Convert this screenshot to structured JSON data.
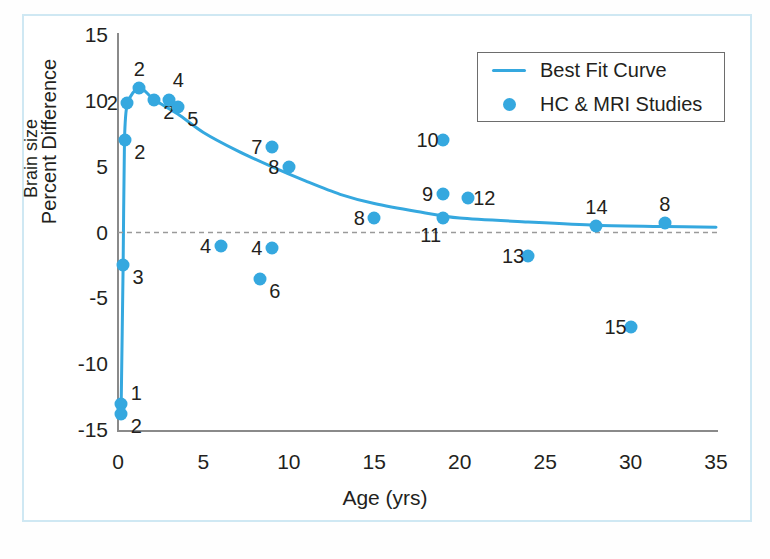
{
  "chart_data": {
    "type": "scatter",
    "title": "",
    "xlabel": "Age (yrs)",
    "ylabel": "Percent Difference",
    "ylabel_2": "Brain size",
    "xlim": [
      0,
      35
    ],
    "ylim": [
      -15,
      15
    ],
    "xticks": [
      "0",
      "5",
      "10",
      "15",
      "20",
      "25",
      "30",
      "35"
    ],
    "yticks": [
      "15",
      "10",
      "5",
      "0",
      "-5",
      "-10",
      "-15"
    ],
    "grid": false,
    "zero_reference_line": 0,
    "legend_position": "top-right",
    "series": [
      {
        "name": "Best Fit Curve",
        "type": "line",
        "color": "#35a8df",
        "points": [
          {
            "x": 0.18,
            "y": -13.6
          },
          {
            "x": 0.3,
            "y": -2.5
          },
          {
            "x": 0.38,
            "y": 7.0
          },
          {
            "x": 0.55,
            "y": 9.8
          },
          {
            "x": 1.25,
            "y": 11.0
          },
          {
            "x": 2.1,
            "y": 10.1
          },
          {
            "x": 3.5,
            "y": 9.0
          },
          {
            "x": 5.0,
            "y": 7.6
          },
          {
            "x": 7.0,
            "y": 6.2
          },
          {
            "x": 9.0,
            "y": 5.0
          },
          {
            "x": 11.0,
            "y": 3.9
          },
          {
            "x": 13.0,
            "y": 2.9
          },
          {
            "x": 15.0,
            "y": 2.2
          },
          {
            "x": 17.5,
            "y": 1.6
          },
          {
            "x": 20.0,
            "y": 1.1
          },
          {
            "x": 24.0,
            "y": 0.8
          },
          {
            "x": 28.0,
            "y": 0.55
          },
          {
            "x": 32.0,
            "y": 0.45
          },
          {
            "x": 35.0,
            "y": 0.4
          }
        ]
      },
      {
        "name": "HC & MRI Studies",
        "type": "scatter",
        "color": "#35a8df",
        "points": [
          {
            "label": "1",
            "x": 0.2,
            "y": -13.0,
            "label_pos": "right-up"
          },
          {
            "label": "2",
            "x": 0.2,
            "y": -13.8,
            "label_pos": "right-down"
          },
          {
            "label": "3",
            "x": 0.3,
            "y": -2.5,
            "label_pos": "right-down"
          },
          {
            "label": "2",
            "x": 0.4,
            "y": 7.0,
            "label_pos": "right-down"
          },
          {
            "label": "2",
            "x": 0.55,
            "y": 9.8,
            "label_pos": "left"
          },
          {
            "label": "2",
            "x": 1.25,
            "y": 11.0,
            "label_pos": "up"
          },
          {
            "label": "2",
            "x": 2.1,
            "y": 10.1,
            "label_pos": "right-down"
          },
          {
            "label": "4",
            "x": 3.0,
            "y": 10.1,
            "label_pos": "up-right"
          },
          {
            "label": "5",
            "x": 3.5,
            "y": 9.5,
            "label_pos": "right-down"
          },
          {
            "label": "4",
            "x": 6.0,
            "y": -1.0,
            "label_pos": "left"
          },
          {
            "label": "4",
            "x": 9.0,
            "y": -1.2,
            "label_pos": "left"
          },
          {
            "label": "6",
            "x": 8.3,
            "y": -3.5,
            "label_pos": "right-down"
          },
          {
            "label": "7",
            "x": 9.0,
            "y": 6.5,
            "label_pos": "left"
          },
          {
            "label": "8",
            "x": 10.0,
            "y": 5.0,
            "label_pos": "left"
          },
          {
            "label": "8",
            "x": 15.0,
            "y": 1.1,
            "label_pos": "left"
          },
          {
            "label": "10",
            "x": 19.0,
            "y": 7.0,
            "label_pos": "left"
          },
          {
            "label": "9",
            "x": 19.0,
            "y": 2.9,
            "label_pos": "left"
          },
          {
            "label": "12",
            "x": 20.5,
            "y": 2.6,
            "label_pos": "right"
          },
          {
            "label": "11",
            "x": 19.0,
            "y": 1.1,
            "label_pos": "down-left"
          },
          {
            "label": "13",
            "x": 24.0,
            "y": -1.8,
            "label_pos": "left"
          },
          {
            "label": "14",
            "x": 28.0,
            "y": 0.5,
            "label_pos": "up"
          },
          {
            "label": "15",
            "x": 30.0,
            "y": -7.2,
            "label_pos": "left"
          },
          {
            "label": "8",
            "x": 32.0,
            "y": 0.7,
            "label_pos": "up"
          }
        ]
      }
    ]
  },
  "legend": {
    "entries": [
      {
        "label": "Best Fit Curve",
        "marker": "line",
        "color": "#35a8df"
      },
      {
        "label": "HC & MRI Studies",
        "marker": "dot",
        "color": "#35a8df"
      }
    ]
  },
  "colors": {
    "accent": "#35a8df",
    "axis": "#8a8a8a",
    "text": "#231f20",
    "frame": "#cfe8f3",
    "zero_line": "#9a9a9a"
  }
}
